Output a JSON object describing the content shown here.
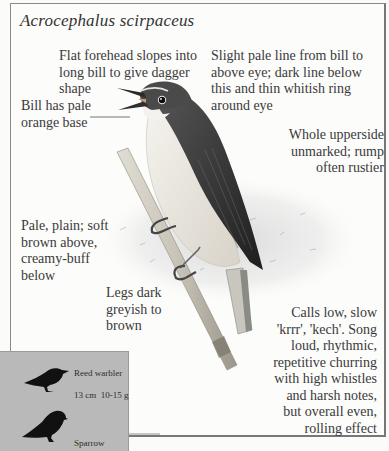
{
  "page": {
    "species_name": "Acrocephalus scirpaceus",
    "annotations": {
      "forehead": [
        "Flat forehead slopes into",
        "long bill to give dagger",
        "shape"
      ],
      "eye_line": [
        "Slight pale line from bill to",
        "above eye; dark line below",
        "this and thin whitish ring",
        "around eye"
      ],
      "bill": [
        "Bill has pale",
        "orange base"
      ],
      "upperside": [
        "Whole upperside",
        "unmarked; rump",
        "often rustier"
      ],
      "plumage": [
        "Pale, plain; soft",
        "brown above,",
        "creamy-buff",
        "below"
      ],
      "legs": [
        "Legs dark",
        "greyish to",
        "brown"
      ],
      "voice": [
        "Calls low, slow",
        "'krrr', 'kech'. Song",
        "loud, rhythmic,",
        "repetitive churring",
        "with high whistles",
        "and harsh notes,",
        "but overall even,",
        "rolling effect"
      ]
    },
    "size_comparison": {
      "species_label": "Reed warbler",
      "measurements": "13 cm  10-15 g",
      "reference_label": "Sparrow"
    },
    "colors": {
      "background": "#fcfcfb",
      "inset_background": "#b9b9b9",
      "silhouette": "#111111",
      "bird_upperparts": "#3d3d3d",
      "bird_underparts": "#e9e6df"
    }
  }
}
